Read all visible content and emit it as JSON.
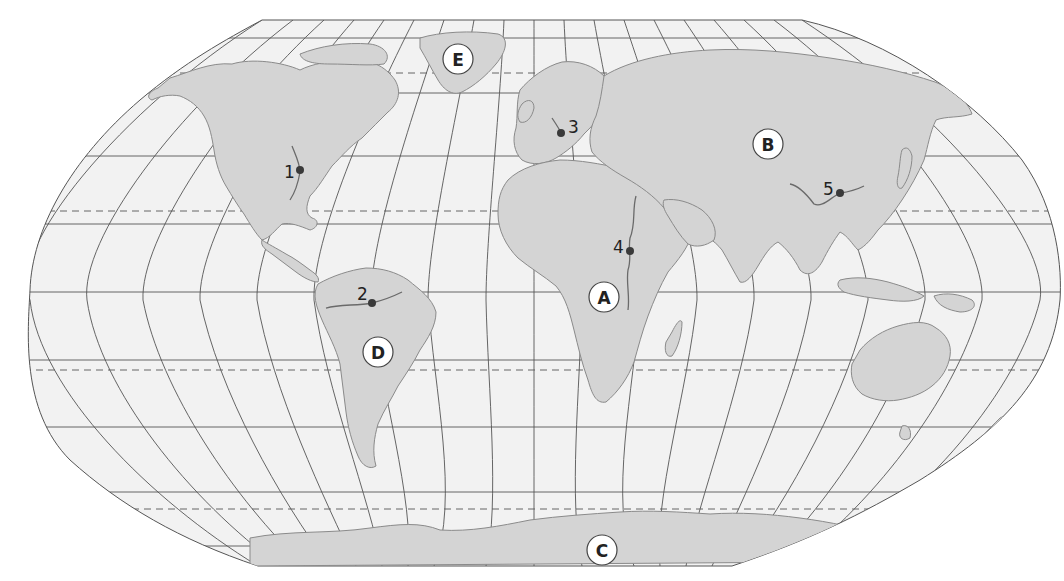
{
  "map": {
    "projection": "Robinson-style world map",
    "colors": {
      "ocean": "#f2f2f2",
      "land": "#d4d4d4",
      "coast": "#8a8a8a",
      "grid": "#555555",
      "background": "#ffffff"
    },
    "region_labels": [
      {
        "id": "A",
        "text": "A",
        "x": 604,
        "y": 297
      },
      {
        "id": "B",
        "text": "B",
        "x": 768,
        "y": 144
      },
      {
        "id": "C",
        "text": "C",
        "x": 602,
        "y": 550
      },
      {
        "id": "D",
        "text": "D",
        "x": 378,
        "y": 352
      },
      {
        "id": "E",
        "text": "E",
        "x": 458,
        "y": 59
      }
    ],
    "point_markers": [
      {
        "id": "1",
        "text": "1",
        "dot_x": 300,
        "dot_y": 170,
        "label_x": 284,
        "label_y": 172
      },
      {
        "id": "2",
        "text": "2",
        "dot_x": 372,
        "dot_y": 303,
        "label_x": 357,
        "label_y": 300
      },
      {
        "id": "3",
        "text": "3",
        "dot_x": 561,
        "dot_y": 133,
        "label_x": 568,
        "label_y": 132
      },
      {
        "id": "4",
        "text": "4",
        "dot_x": 630,
        "dot_y": 251,
        "label_x": 613,
        "label_y": 252
      },
      {
        "id": "5",
        "text": "5",
        "dot_x": 840,
        "dot_y": 193,
        "label_x": 823,
        "label_y": 193
      }
    ],
    "lines": {
      "tropics_dashed": [
        "Arctic Circle",
        "Tropic of Cancer",
        "Tropic of Capricorn",
        "Antarctic Circle"
      ]
    }
  }
}
